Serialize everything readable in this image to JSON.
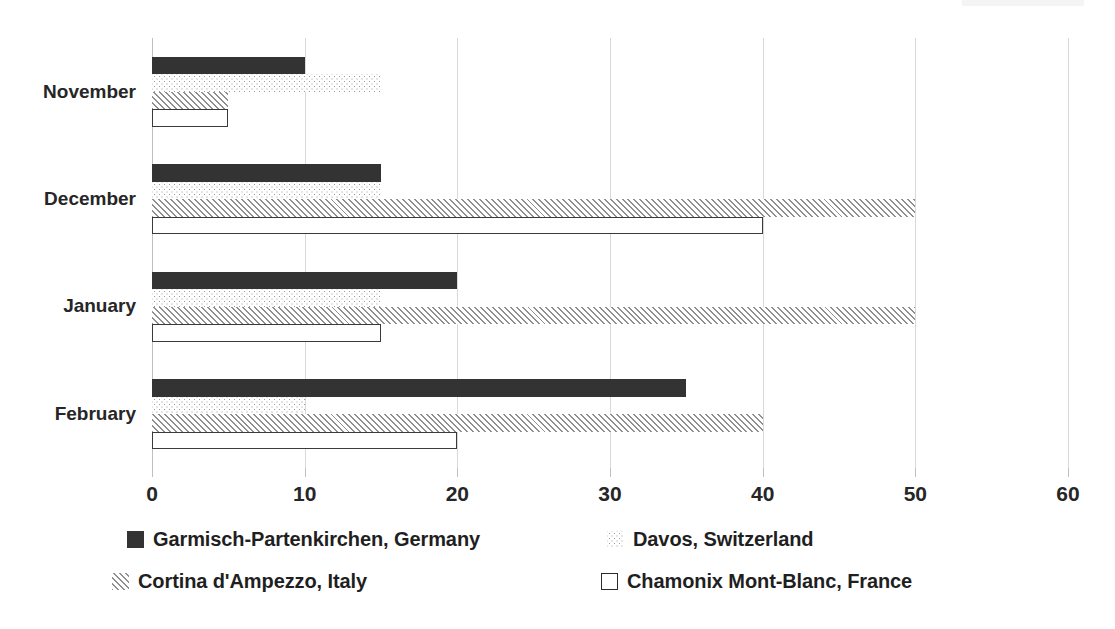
{
  "chart_data": {
    "type": "bar",
    "orientation": "horizontal",
    "title": "",
    "subtitle": "",
    "xlabel": "",
    "ylabel": "",
    "categories": [
      "November",
      "December",
      "January",
      "February"
    ],
    "series": [
      {
        "name": "Garmisch-Partenkirchen, Germany",
        "values": [
          10,
          15,
          20,
          35
        ],
        "pattern": "solid-dark",
        "color": "#333333"
      },
      {
        "name": "Davos, Switzerland",
        "values": [
          15,
          15,
          15,
          10
        ],
        "pattern": "fine-dotted",
        "color": "#9a9a9a"
      },
      {
        "name": "Cortina d'Ampezzo, Italy",
        "values": [
          5,
          50,
          50,
          40
        ],
        "pattern": "diagonal-hatch",
        "color": "#8f8f8f"
      },
      {
        "name": "Chamonix Mont-Blanc, France",
        "values": [
          5,
          40,
          15,
          20
        ],
        "pattern": "white-outline",
        "color": "#ffffff"
      }
    ],
    "xlim": [
      0,
      60
    ],
    "xticks": [
      0,
      10,
      20,
      30,
      40,
      50,
      60
    ],
    "xtick_labels": [
      "0",
      "10",
      "20",
      "30",
      "40",
      "50",
      "60"
    ],
    "grid": true,
    "grid_axis": "x",
    "legend_position": "bottom",
    "legend_columns": 2
  },
  "axis": {
    "tick_labels": [
      "0",
      "10",
      "20",
      "30",
      "40",
      "50",
      "60"
    ]
  },
  "categories": {
    "labels": [
      "November",
      "December",
      "January",
      "February"
    ]
  },
  "legend": {
    "items": [
      {
        "label": "Garmisch-Partenkirchen, Germany"
      },
      {
        "label": "Davos, Switzerland"
      },
      {
        "label": "Cortina d'Ampezzo, Italy"
      },
      {
        "label": "Chamonix Mont-Blanc, France"
      }
    ]
  }
}
